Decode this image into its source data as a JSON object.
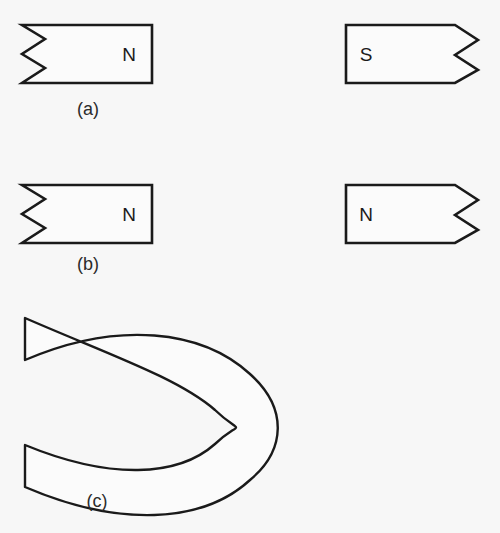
{
  "figure": {
    "background_color": "#f7f7f7",
    "ink_color": "#1a1a1a",
    "width": 500,
    "height": 533
  },
  "panels": [
    {
      "id": "a",
      "label": "(a)",
      "label_x": 88,
      "label_y": 110,
      "description": "Two bar magnets with jagged broken ends facing each other, left pole N and right pole S",
      "magnets": [
        {
          "side": "left",
          "pole_label": "N",
          "pole_x": 129,
          "pole_y": 55,
          "jagged_edge": "left",
          "x_flat": 152,
          "x_notch_tip": 22,
          "x_notch_base": 45,
          "y_top": 25,
          "y_bottom": 83,
          "notches": 2
        },
        {
          "side": "right",
          "pole_label": "S",
          "pole_x": 366,
          "pole_y": 55,
          "jagged_edge": "right",
          "x_flat": 346,
          "x_notch_tip": 478,
          "x_notch_base": 455,
          "y_top": 25,
          "y_bottom": 83,
          "notches": 2
        }
      ]
    },
    {
      "id": "b",
      "label": "(b)",
      "label_x": 88,
      "label_y": 265,
      "description": "Two bar magnets with jagged broken ends facing each other, both poles labelled N",
      "magnets": [
        {
          "side": "left",
          "pole_label": "N",
          "pole_x": 129,
          "pole_y": 215,
          "jagged_edge": "left",
          "x_flat": 152,
          "x_notch_tip": 22,
          "x_notch_base": 45,
          "y_top": 185,
          "y_bottom": 243,
          "notches": 2
        },
        {
          "side": "right",
          "pole_label": "N",
          "pole_x": 366,
          "pole_y": 215,
          "jagged_edge": "right",
          "x_flat": 346,
          "x_notch_tip": 478,
          "x_notch_base": 455,
          "y_top": 185,
          "y_bottom": 243,
          "notches": 2
        }
      ]
    },
    {
      "id": "c",
      "label": "(c)",
      "label_x": 97,
      "label_y": 502,
      "description": "Horseshoe magnet, U-shape opening toward the left with rounded bend on the right",
      "horseshoe": {
        "outer_path": "M 25 318 L 25 360 C 120 322 205 330 252 375 C 288 410 284 448 252 478 C 205 522 120 525 25 487 L 25 445",
        "tip_top_y": 318,
        "tip_bottom_y": 487,
        "arm_x": 25,
        "bend_right_x": 277,
        "inner_bend_x": 245
      }
    }
  ]
}
